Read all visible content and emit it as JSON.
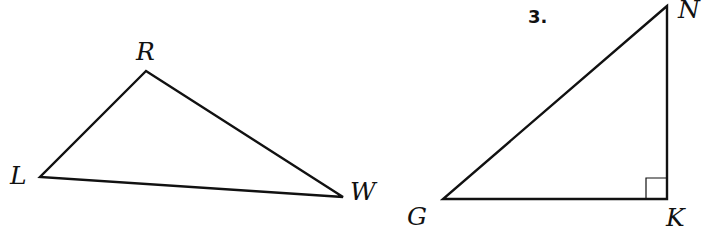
{
  "problem_number": "3.",
  "triangles": [
    {
      "name": "triangle-LRW",
      "vertices": [
        {
          "label": "R",
          "x": 146,
          "y": 71,
          "lx": 136,
          "ly": 60
        },
        {
          "label": "L",
          "x": 40,
          "y": 177,
          "lx": 10,
          "ly": 184
        },
        {
          "label": "W",
          "x": 343,
          "y": 197,
          "lx": 350,
          "ly": 200
        }
      ],
      "right_angle": null
    },
    {
      "name": "triangle-GNK",
      "vertices": [
        {
          "label": "N",
          "x": 667,
          "y": 6,
          "lx": 678,
          "ly": 18
        },
        {
          "label": "G",
          "x": 443,
          "y": 199,
          "lx": 407,
          "ly": 225
        },
        {
          "label": "K",
          "x": 667,
          "y": 199,
          "lx": 666,
          "ly": 226
        }
      ],
      "right_angle": {
        "vertex": "K",
        "size": 21
      }
    }
  ],
  "colors": {
    "stroke": "#111111",
    "background": "#ffffff"
  }
}
